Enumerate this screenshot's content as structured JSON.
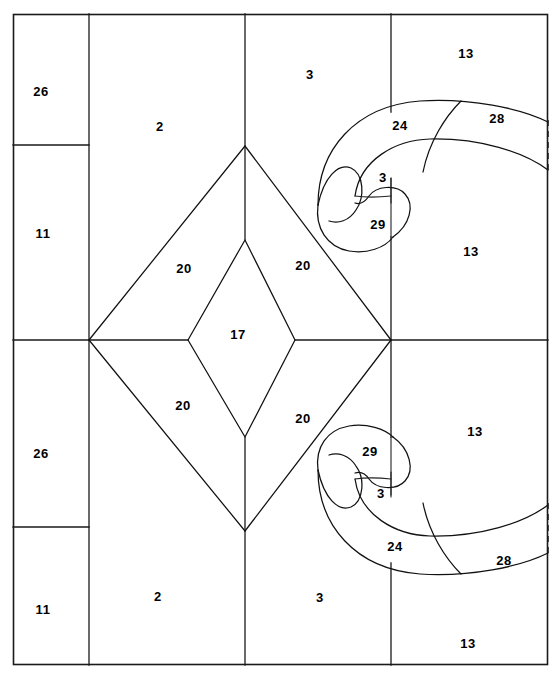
{
  "diagram": {
    "type": "technical-line-drawing",
    "frame": {
      "x": 13,
      "y": 14,
      "width": 535,
      "height": 651
    },
    "stroke_color": "#111111",
    "background_color": "#ffffff",
    "part_labels": [
      {
        "id": "label-26-top",
        "number": "26",
        "x": 41,
        "y": 93
      },
      {
        "id": "label-2-top",
        "number": "2",
        "x": 160,
        "y": 128
      },
      {
        "id": "label-11-top",
        "number": "11",
        "x": 43,
        "y": 235
      },
      {
        "id": "label-3-top",
        "number": "3",
        "x": 310,
        "y": 76
      },
      {
        "id": "label-13-topright",
        "number": "13",
        "x": 466,
        "y": 55
      },
      {
        "id": "label-24-top",
        "number": "24",
        "x": 400,
        "y": 127
      },
      {
        "id": "label-28-top",
        "number": "28",
        "x": 497,
        "y": 120
      },
      {
        "id": "label-3-curl-top",
        "number": "3",
        "x": 383,
        "y": 179
      },
      {
        "id": "label-29-top",
        "number": "29",
        "x": 378,
        "y": 226
      },
      {
        "id": "label-13-right-upper",
        "number": "13",
        "x": 471,
        "y": 253
      },
      {
        "id": "label-20-upper-left",
        "number": "20",
        "x": 184,
        "y": 270
      },
      {
        "id": "label-20-upper-right",
        "number": "20",
        "x": 303,
        "y": 267
      },
      {
        "id": "label-17-center",
        "number": "17",
        "x": 238,
        "y": 336
      },
      {
        "id": "label-20-lower-left",
        "number": "20",
        "x": 183,
        "y": 407
      },
      {
        "id": "label-20-lower-right",
        "number": "20",
        "x": 303,
        "y": 420
      },
      {
        "id": "label-26-bottom",
        "number": "26",
        "x": 41,
        "y": 455
      },
      {
        "id": "label-11-bottom",
        "number": "11",
        "x": 43,
        "y": 611
      },
      {
        "id": "label-2-bottom",
        "number": "2",
        "x": 158,
        "y": 598
      },
      {
        "id": "label-3-bottom",
        "number": "3",
        "x": 320,
        "y": 599
      },
      {
        "id": "label-29-bottom",
        "number": "29",
        "x": 370,
        "y": 453
      },
      {
        "id": "label-3-curl-bottom",
        "number": "3",
        "x": 381,
        "y": 495
      },
      {
        "id": "label-24-bottom",
        "number": "24",
        "x": 395,
        "y": 548
      },
      {
        "id": "label-28-bottom",
        "number": "28",
        "x": 504,
        "y": 562
      },
      {
        "id": "label-13-right-lower",
        "number": "13",
        "x": 475,
        "y": 433
      },
      {
        "id": "label-13-bottomright",
        "number": "13",
        "x": 468,
        "y": 645
      }
    ],
    "regions": [
      {
        "name": "region-26-top",
        "number": "26"
      },
      {
        "name": "region-11-top",
        "number": "11"
      },
      {
        "name": "region-26-bottom",
        "number": "26"
      },
      {
        "name": "region-11-bottom",
        "number": "11"
      },
      {
        "name": "region-2-top",
        "number": "2"
      },
      {
        "name": "region-2-bottom",
        "number": "2"
      },
      {
        "name": "region-3-top",
        "number": "3"
      },
      {
        "name": "region-3-bottom",
        "number": "3"
      },
      {
        "name": "region-17-center",
        "number": "17"
      },
      {
        "name": "region-20-upper-left",
        "number": "20"
      },
      {
        "name": "region-20-upper-right",
        "number": "20"
      },
      {
        "name": "region-20-lower-left",
        "number": "20"
      },
      {
        "name": "region-20-lower-right",
        "number": "20"
      },
      {
        "name": "region-13-topright",
        "number": "13"
      },
      {
        "name": "region-13-right-upper",
        "number": "13"
      },
      {
        "name": "region-13-right-lower",
        "number": "13"
      },
      {
        "name": "region-13-bottomright",
        "number": "13"
      },
      {
        "name": "region-24-top",
        "number": "24"
      },
      {
        "name": "region-24-bottom",
        "number": "24"
      },
      {
        "name": "region-28-top",
        "number": "28"
      },
      {
        "name": "region-28-bottom",
        "number": "28"
      },
      {
        "name": "region-29-top",
        "number": "29"
      },
      {
        "name": "region-29-bottom",
        "number": "29"
      },
      {
        "name": "region-3-curl-top",
        "number": "3"
      },
      {
        "name": "region-3-curl-bottom",
        "number": "3"
      }
    ]
  }
}
